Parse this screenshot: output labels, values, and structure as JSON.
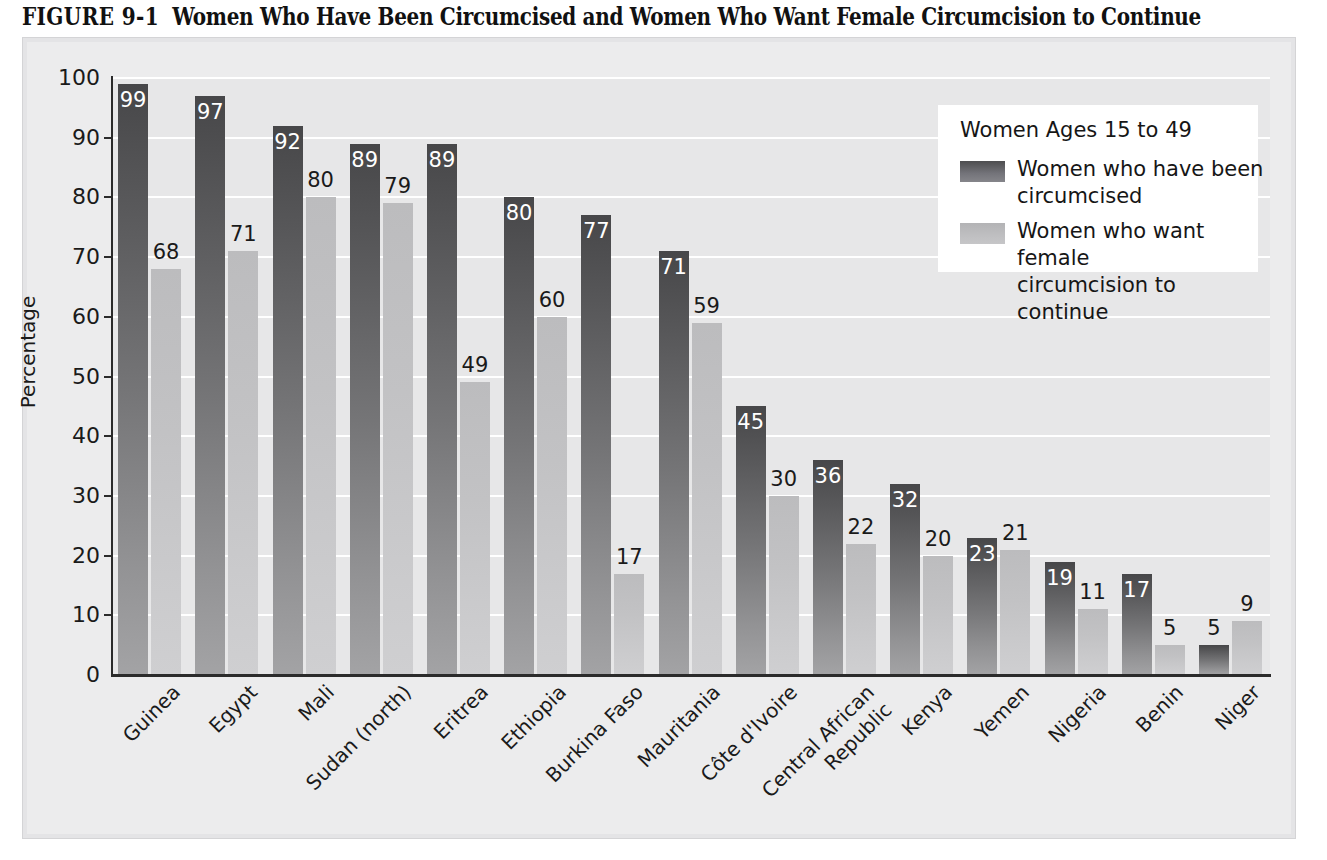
{
  "title": {
    "figure_number": "FIGURE 9-1",
    "text": "Women Who Have Been Circumcised and Women Who Want Female Circumcision to Continue"
  },
  "legend": {
    "title": "Women Ages 15 to 49",
    "entries": [
      {
        "label": "Women who have been\ncircumcised",
        "color": "#5a5a5c",
        "style": "dark"
      },
      {
        "label": "Women who want female\ncircumcision to continue",
        "color": "#c2c2c4",
        "style": "light"
      }
    ]
  },
  "chart_data": {
    "type": "bar",
    "title": "Women Who Have Been Circumcised and Women Who Want Female Circumcision to Continue",
    "xlabel": "",
    "ylabel": "Percentage",
    "ylim": [
      0,
      100
    ],
    "yticks": [
      0,
      10,
      20,
      30,
      40,
      50,
      60,
      70,
      80,
      90,
      100
    ],
    "ytick_labels": [
      "0",
      "10",
      "20",
      "30",
      "40",
      "50",
      "60",
      "70",
      "80",
      "90",
      "100"
    ],
    "grid": true,
    "legend_position": "top-right",
    "categories": [
      "Guinea",
      "Egypt",
      "Mali",
      "Sudan (north)",
      "Eritrea",
      "Ethiopia",
      "Burkina Faso",
      "Mauritania",
      "Côte d'Ivoire",
      "Central African\nRepublic",
      "Kenya",
      "Yemen",
      "Nigeria",
      "Benin",
      "Niger"
    ],
    "series": [
      {
        "name": "Women who have been circumcised",
        "color": "#5a5a5c",
        "values": [
          99,
          97,
          92,
          89,
          89,
          80,
          77,
          71,
          45,
          36,
          32,
          23,
          19,
          17,
          5
        ]
      },
      {
        "name": "Women who want female circumcision to continue",
        "color": "#c2c2c4",
        "values": [
          68,
          71,
          80,
          79,
          49,
          60,
          17,
          59,
          30,
          22,
          20,
          21,
          11,
          5,
          9
        ]
      }
    ]
  }
}
